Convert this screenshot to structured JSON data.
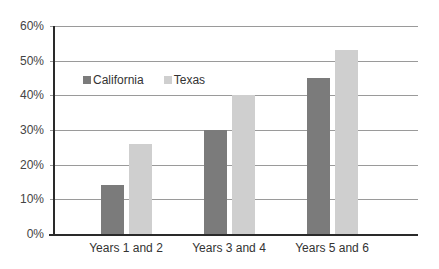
{
  "chart_data": {
    "type": "bar",
    "title": "",
    "xlabel": "",
    "ylabel": "",
    "categories": [
      "Years 1 and 2",
      "Years 3 and 4",
      "Years 5 and 6"
    ],
    "series": [
      {
        "name": "California",
        "values": [
          14,
          30,
          45
        ],
        "color": "#7b7b7b"
      },
      {
        "name": "Texas",
        "values": [
          26,
          40,
          53
        ],
        "color": "#cfcfcf"
      }
    ],
    "ylim": [
      0,
      60
    ],
    "yticks": [
      "0%",
      "10%",
      "20%",
      "30%",
      "40%",
      "50%",
      "60%"
    ],
    "grid": true,
    "legend_position": "upper-left inside plot"
  },
  "legend": {
    "items": [
      {
        "label": "California",
        "color": "#7b7b7b"
      },
      {
        "label": "Texas",
        "color": "#cfcfcf"
      }
    ]
  }
}
